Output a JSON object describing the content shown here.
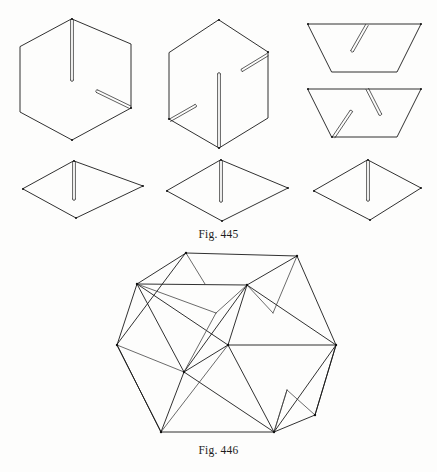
{
  "page": {
    "background_color": "#fdfdfc",
    "ink_color": "#1a1a1a",
    "width": 437,
    "height": 472
  },
  "figures": [
    {
      "id": "fig-445",
      "caption": "Fig. 445",
      "description": "Six flat cardboard/paper pieces with notched slots used to assemble a polyhedron",
      "pieces": [
        {
          "name": "hexagon-piece-1",
          "shape": "hexagon",
          "slots": 2,
          "slot_notes": "one vertical slot from top vertex downward; one short diagonal slot entering from lower-right edge"
        },
        {
          "name": "hexagon-piece-2",
          "shape": "hexagon",
          "slots": 3,
          "slot_notes": "one vertical slot from bottom vertex upward; one diagonal slot at upper-right edge; one diagonal slot at lower-left edge"
        },
        {
          "name": "trapezoid-piece-1",
          "shape": "trapezoid",
          "slots": 1,
          "slot_notes": "one diagonal slot descending from the top edge toward the lower left"
        },
        {
          "name": "trapezoid-piece-2",
          "shape": "trapezoid",
          "slots": 2,
          "slot_notes": "one diagonal slot from the top edge and one diagonal slot rising from the bottom-left corner"
        },
        {
          "name": "rhombus-piece-1",
          "shape": "rhombus",
          "slots": 1,
          "slot_notes": "vertical slot descending from the top vertex"
        },
        {
          "name": "rhombus-piece-2",
          "shape": "rhombus",
          "slots": 1,
          "slot_notes": "vertical slot descending from the top vertex"
        },
        {
          "name": "rhombus-piece-3",
          "shape": "rhombus",
          "slots": 1,
          "slot_notes": "vertical slot descending from the top vertex"
        }
      ]
    },
    {
      "id": "fig-446",
      "caption": "Fig. 446",
      "description": "Assembled wireframe polyhedron (cuboctahedron-like solid) built from the interlocking slotted pieces of Fig. 445"
    }
  ]
}
